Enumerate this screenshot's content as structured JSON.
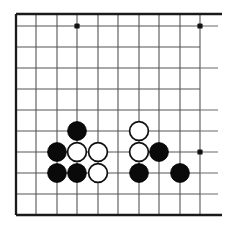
{
  "diagram": {
    "kind": "go-board",
    "board_style": "printed-scan",
    "colors": {
      "background": "#ffffff",
      "grid": "#555555",
      "border": "#1a1a1a",
      "black_stone": "#0a0a0a",
      "white_stone": "#ffffff",
      "white_stone_outline": "#101010",
      "star_point": "#111111"
    },
    "geometry": {
      "image_width": 226,
      "image_height": 236,
      "cell_size": 20.8,
      "origin_x": 16,
      "origin_y": 14,
      "columns": 10,
      "rows": 10,
      "stone_radius": 9.4
    },
    "grid": {
      "vertical_x": [
        16,
        36,
        57,
        77,
        98,
        118,
        139,
        159,
        180,
        200
      ],
      "horizontal_y": [
        14,
        26,
        47,
        68,
        89,
        110,
        131,
        152,
        173,
        194,
        215
      ],
      "border_top_y": 14,
      "border_bottom_y": 215,
      "border_left_x": 16,
      "right_open": true
    },
    "star_points": [
      {
        "name": "star-point-top-left-area",
        "x": 77,
        "y": 26
      },
      {
        "name": "star-point-top-right-area",
        "x": 200,
        "y": 26
      },
      {
        "name": "star-point-right-lower",
        "x": 200,
        "y": 152
      }
    ],
    "stub_lines": [
      {
        "name": "stub-right-row-2",
        "x1": 200,
        "y1": 26,
        "x2": 218,
        "y2": 26
      },
      {
        "name": "stub-right-row-4",
        "x1": 200,
        "y1": 68,
        "x2": 218,
        "y2": 68
      },
      {
        "name": "stub-right-row-6",
        "x1": 200,
        "y1": 110,
        "x2": 218,
        "y2": 110
      },
      {
        "name": "stub-right-row-7",
        "x1": 200,
        "y1": 131,
        "x2": 218,
        "y2": 131
      },
      {
        "name": "stub-right-row-8",
        "x1": 200,
        "y1": 152,
        "x2": 218,
        "y2": 152
      },
      {
        "name": "stub-right-row-9",
        "x1": 200,
        "y1": 173,
        "x2": 218,
        "y2": 173
      },
      {
        "name": "stub-right-row-10",
        "x1": 200,
        "y1": 194,
        "x2": 218,
        "y2": 194
      },
      {
        "name": "stub-right-row-bottom",
        "x1": 200,
        "y1": 215,
        "x2": 218,
        "y2": 215
      }
    ],
    "stones": [
      {
        "id": "black-1",
        "color": "black",
        "x": 77,
        "y": 131,
        "col": 4,
        "row": 7
      },
      {
        "id": "black-2",
        "color": "black",
        "x": 57,
        "y": 152,
        "col": 3,
        "row": 8
      },
      {
        "id": "black-3",
        "color": "black",
        "x": 57,
        "y": 173,
        "col": 3,
        "row": 9
      },
      {
        "id": "black-4",
        "color": "black",
        "x": 77,
        "y": 173,
        "col": 4,
        "row": 9
      },
      {
        "id": "black-5",
        "color": "black",
        "x": 159,
        "y": 152,
        "col": 8,
        "row": 8
      },
      {
        "id": "black-6",
        "color": "black",
        "x": 139,
        "y": 173,
        "col": 7,
        "row": 9
      },
      {
        "id": "black-7",
        "color": "black",
        "x": 180,
        "y": 173,
        "col": 9,
        "row": 9
      },
      {
        "id": "white-1",
        "color": "white",
        "x": 77,
        "y": 152,
        "col": 4,
        "row": 8
      },
      {
        "id": "white-2",
        "color": "white",
        "x": 98,
        "y": 152,
        "col": 5,
        "row": 8
      },
      {
        "id": "white-3",
        "color": "white",
        "x": 98,
        "y": 173,
        "col": 5,
        "row": 9
      },
      {
        "id": "white-4",
        "color": "white",
        "x": 139,
        "y": 131,
        "col": 7,
        "row": 7
      },
      {
        "id": "white-5",
        "color": "white",
        "x": 139,
        "y": 152,
        "col": 7,
        "row": 8
      }
    ],
    "counts": {
      "black_stones": "7",
      "white_stones": "5",
      "total_stones": "12"
    }
  }
}
